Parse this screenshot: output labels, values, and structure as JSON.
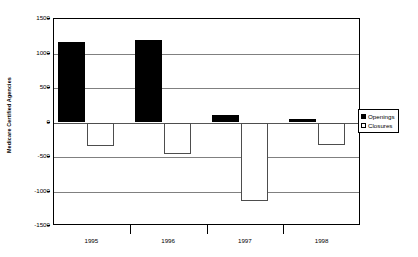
{
  "chart_data": {
    "type": "bar",
    "title": "",
    "subtitle": "",
    "xlabel": "",
    "ylabel": "Medicare Certified Agencies",
    "categories": [
      "1995",
      "1996",
      "1997",
      "1998"
    ],
    "series": [
      {
        "name": "Openings",
        "color": "#000000",
        "values": [
          1165,
          1200,
          110,
          55
        ]
      },
      {
        "name": "Closures",
        "color": "#ffffff",
        "values": [
          -340,
          -460,
          -1140,
          -320
        ]
      }
    ],
    "ylim": [
      -1500,
      1500
    ],
    "ytick_values": [
      1500,
      1000,
      500,
      0,
      -500,
      -1000,
      -1500
    ],
    "ytick_labels": [
      "1500",
      "1000",
      "500",
      "0",
      "-500",
      "-1000",
      "-1500"
    ],
    "grid": true,
    "legend_position": "right",
    "orientation": "vertical",
    "grouping": "clustered"
  },
  "legend": {
    "items": [
      {
        "label": "Openings",
        "marker": "filled-square-icon"
      },
      {
        "label": "Closures",
        "marker": "hollow-square-icon"
      }
    ]
  },
  "axes": {
    "y_title": "Medicare Certified Agencies"
  },
  "colors": {
    "openings": "#000000",
    "closures": "#ffffff",
    "gridline": "#808080",
    "frame": "#000000",
    "background": "#ffffff"
  }
}
